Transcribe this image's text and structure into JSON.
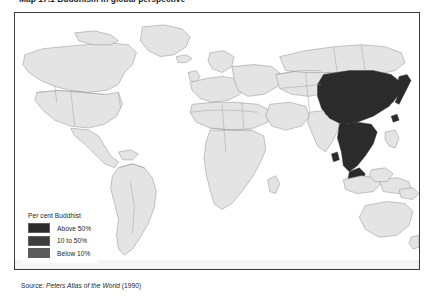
{
  "figure": {
    "title": "Map 17.1 Buddhism in global perspective",
    "source_prefix": "Source:",
    "source_title": "Peters Atlas of the World",
    "source_year": "(1990)"
  },
  "legend": {
    "title": "Per cent Buddhist",
    "items": [
      {
        "label": "Above 50%",
        "color": "#2b2b2b"
      },
      {
        "label": "10 to 50%",
        "color": "#3d3d3d"
      },
      {
        "label": "Below 10%",
        "color": "#5a5a5a"
      }
    ]
  },
  "map": {
    "projection": "Peters (equal-area cylindrical)",
    "land_fill": "#e4e4e4",
    "border_stroke": "#8d8d8d",
    "frame_stroke": "#3b3b3b",
    "ocean_fill": "#ffffff",
    "high_fill": "#2b2b2b",
    "regions_above_50": [
      "China",
      "Mongolia",
      "Japan",
      "North Korea",
      "South Korea",
      "Myanmar",
      "Thailand",
      "Laos",
      "Cambodia",
      "Vietnam",
      "Bhutan",
      "Nepal",
      "Sri Lanka",
      "Taiwan"
    ]
  }
}
